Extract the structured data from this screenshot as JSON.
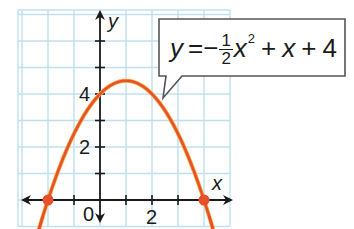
{
  "chart_data": {
    "type": "line",
    "title": "",
    "equation_label": "y = -1/2 x^2 + x + 4",
    "function": "y = -0.5*x^2 + x + 4",
    "xlabel": "x",
    "ylabel": "y",
    "xlim": [
      -3,
      5
    ],
    "ylim": [
      -1,
      7
    ],
    "grid": true,
    "x_tick_labels": [
      {
        "value": 0,
        "label": "0"
      },
      {
        "value": 2,
        "label": "2"
      }
    ],
    "y_tick_labels": [
      {
        "value": 2,
        "label": "2"
      },
      {
        "value": 4,
        "label": "4"
      }
    ],
    "x_ticks": [
      -2,
      -1,
      1,
      2,
      3,
      4
    ],
    "y_ticks": [
      1,
      2,
      3,
      4,
      5,
      6
    ],
    "series": [
      {
        "name": "parabola",
        "x": [
          -2.4,
          -2,
          -1,
          0,
          1,
          2,
          3,
          4,
          4.4
        ],
        "y": [
          -1.28,
          0,
          2.5,
          4,
          4.5,
          4,
          2.5,
          0,
          -1.28
        ]
      }
    ],
    "marked_points": [
      {
        "x": -2,
        "y": 0,
        "label": "x-intercept"
      },
      {
        "x": 4,
        "y": 0,
        "label": "x-intercept"
      }
    ],
    "vertex": {
      "x": 1,
      "y": 4.5
    },
    "y_intercept": {
      "x": 0,
      "y": 4
    }
  },
  "labels": {
    "axis_x": "x",
    "axis_y": "y",
    "tick_x_0": "0",
    "tick_x_2": "2",
    "tick_y_2": "2",
    "tick_y_4": "4"
  },
  "callout": {
    "y": "y",
    "equals_minus": "=−",
    "numerator": "1",
    "denominator": "2",
    "x": "x",
    "exponent": "2",
    "plus1": "+",
    "x2": "x",
    "plus2": "+",
    "constant": "4"
  },
  "colors": {
    "grid": "#bfe0f0",
    "curve": "#e8502a",
    "curve_highlight": "#f6b24a",
    "axis": "#1a1a1a",
    "callout_border": "#555555"
  }
}
